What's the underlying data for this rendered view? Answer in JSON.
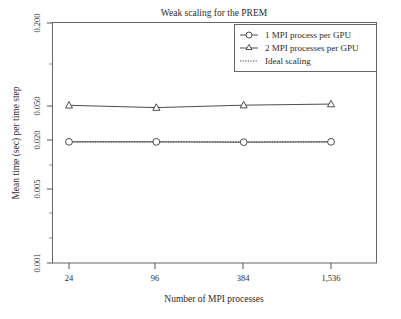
{
  "chart_data": {
    "type": "line",
    "title": "Weak scaling for the PREM",
    "xlabel": "Number of MPI processes",
    "ylabel": "Mean time (sec) per time step",
    "xscale": "log",
    "yscale": "log",
    "grid": false,
    "legend_position": "top-right",
    "x": [
      24,
      96,
      384,
      1536
    ],
    "xticklabels": [
      "24",
      "96",
      "384",
      "1,536"
    ],
    "yticklabels": [
      "0.200",
      "0.050",
      "0.020",
      "0.005",
      "0.001"
    ],
    "yticks": [
      0.2,
      0.05,
      0.02,
      0.005,
      0.001
    ],
    "ylim": [
      0.001,
      0.26
    ],
    "series": [
      {
        "name": "1 MPI process per GPU",
        "marker": "circle",
        "linestyle": "solid",
        "values": [
          0.0145,
          0.0145,
          0.0144,
          0.0145
        ]
      },
      {
        "name": "2 MPI processes per GPU",
        "marker": "triangle",
        "linestyle": "solid",
        "values": [
          0.0325,
          0.0309,
          0.0326,
          0.0334
        ]
      },
      {
        "name": "Ideal scaling",
        "marker": "none",
        "linestyle": "dotted",
        "values": [
          0.0145,
          0.0145,
          0.0145,
          0.0145
        ]
      }
    ]
  },
  "legend": {
    "entries": [
      {
        "label": "1 MPI process per GPU",
        "marker": "circle"
      },
      {
        "label": "2 MPI processes per GPU",
        "marker": "triangle"
      },
      {
        "label": "Ideal scaling",
        "marker": "dotted"
      }
    ]
  },
  "colors": {
    "line": "#3a3a3a",
    "frame": "#555555",
    "text": "#2b2b2b",
    "background": "#ffffff"
  }
}
